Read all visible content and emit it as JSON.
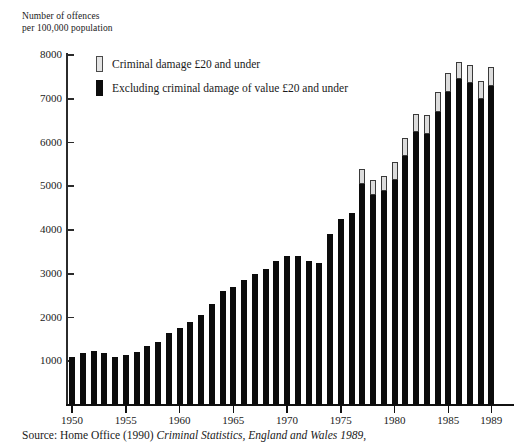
{
  "axis_title": "Number of offences\nper 100,000 population",
  "legend": {
    "items": [
      {
        "key": "light",
        "label": "Criminal damage £20 and under"
      },
      {
        "key": "dark",
        "label": "Excluding criminal damage of value £20 and under"
      }
    ]
  },
  "source": {
    "prefix": "Source: Home Office (1990) ",
    "italic": "Criminal Statistics, England and Wales 1989",
    "suffix": ","
  },
  "colors": {
    "dark_series": "#0c0c0c",
    "light_series": "#dcdcdc",
    "light_series_outline": "#3a3a3a",
    "axis": "#111111",
    "text": "#1a1a1a",
    "background": "#ffffff"
  },
  "chart_data": {
    "type": "bar",
    "stacked": true,
    "title": "",
    "xlabel": "",
    "ylabel": "Number of offences per 100,000 population",
    "ylim": [
      0,
      8300
    ],
    "yticks": [
      1000,
      2000,
      3000,
      4000,
      5000,
      6000,
      7000,
      8000
    ],
    "ytick_labels": [
      "1000",
      "2000",
      "3000",
      "4000",
      "5000",
      "6000",
      "7000",
      "8000"
    ],
    "xticks": [
      1950,
      1955,
      1960,
      1965,
      1970,
      1975,
      1980,
      1985,
      1989
    ],
    "xtick_labels": [
      "1950",
      "1955",
      "1960",
      "1965",
      "1970",
      "1975",
      "1980",
      "1985",
      "1989"
    ],
    "grid": false,
    "legend_position": "upper-left-inside",
    "categories": [
      1950,
      1951,
      1952,
      1953,
      1954,
      1955,
      1956,
      1957,
      1958,
      1959,
      1960,
      1961,
      1962,
      1963,
      1964,
      1965,
      1966,
      1967,
      1968,
      1969,
      1970,
      1971,
      1972,
      1973,
      1974,
      1975,
      1976,
      1977,
      1978,
      1979,
      1980,
      1981,
      1982,
      1983,
      1984,
      1985,
      1986,
      1987,
      1988,
      1989
    ],
    "series": [
      {
        "name": "Excluding criminal damage of value £20 and under",
        "color": "#0c0c0c",
        "values": [
          1100,
          1200,
          1230,
          1200,
          1100,
          1150,
          1220,
          1350,
          1450,
          1650,
          1750,
          1900,
          2050,
          2300,
          2600,
          2700,
          2850,
          3000,
          3100,
          3300,
          3400,
          3400,
          3300,
          3250,
          3900,
          4250,
          4400,
          5050,
          4800,
          4900,
          5150,
          5700,
          6250,
          6200,
          6700,
          7150,
          7450,
          7350,
          7000,
          7300
        ]
      },
      {
        "name": "Criminal damage £20 and under",
        "color": "#dcdcdc",
        "values": [
          0,
          0,
          0,
          0,
          0,
          0,
          0,
          0,
          0,
          0,
          0,
          0,
          0,
          0,
          0,
          0,
          0,
          0,
          0,
          0,
          0,
          0,
          0,
          0,
          0,
          0,
          0,
          350,
          340,
          330,
          400,
          400,
          400,
          430,
          450,
          450,
          400,
          430,
          400,
          420
        ]
      }
    ],
    "totals": [
      1100,
      1200,
      1230,
      1200,
      1100,
      1150,
      1220,
      1350,
      1450,
      1650,
      1750,
      1900,
      2050,
      2300,
      2600,
      2700,
      2850,
      3000,
      3100,
      3300,
      3400,
      3400,
      3300,
      3250,
      3900,
      4250,
      4400,
      5400,
      5140,
      5230,
      5550,
      6100,
      6650,
      6630,
      7150,
      7600,
      7850,
      7780,
      7400,
      7720
    ]
  }
}
